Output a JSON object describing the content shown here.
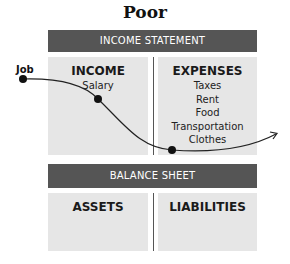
{
  "title": "Poor",
  "income_statement": {
    "header": "INCOME STATEMENT",
    "income": {
      "title": "INCOME",
      "items": [
        "Salary"
      ]
    },
    "expenses": {
      "title": "EXPENSES",
      "items": [
        "Taxes",
        "Rent",
        "Food",
        "Transportation",
        "Clothes"
      ]
    }
  },
  "balance_sheet": {
    "header": "BALANCE SHEET",
    "assets": {
      "title": "ASSETS"
    },
    "liabilities": {
      "title": "LIABILITIES"
    }
  },
  "flow": {
    "start_label": "Job",
    "color": "#222222"
  },
  "colors": {
    "bar": "#555555",
    "box": "#e6e6e6"
  }
}
